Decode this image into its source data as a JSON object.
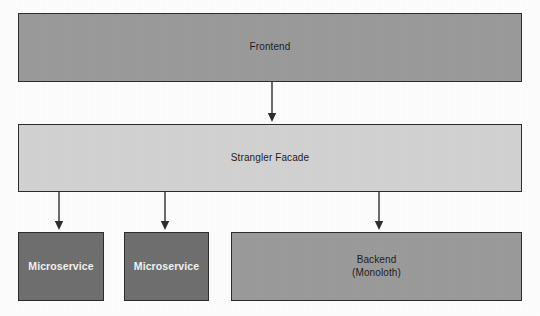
{
  "diagram": {
    "background_color": "#fdfdfd",
    "nodes": [
      {
        "id": "frontend",
        "label": "Frontend",
        "fill": "#9a9a9a",
        "border": "#2b2b2b",
        "text_color": "#1c1c1c",
        "x": 18,
        "y": 13,
        "w": 504,
        "h": 69
      },
      {
        "id": "strangler-facade",
        "label": "Strangler Facade",
        "fill": "#d2d2d2",
        "border": "#2b2b2b",
        "text_color": "#1c1c1c",
        "x": 18,
        "y": 124,
        "w": 504,
        "h": 68
      },
      {
        "id": "microservice-1",
        "label": "Microservice",
        "fill": "#6e6e6e",
        "border": "#2b2b2b",
        "text_color": "#f2f2f2",
        "x": 18,
        "y": 232,
        "w": 86,
        "h": 69
      },
      {
        "id": "microservice-2",
        "label": "Microservice",
        "fill": "#6e6e6e",
        "border": "#2b2b2b",
        "text_color": "#f2f2f2",
        "x": 124,
        "y": 232,
        "w": 85,
        "h": 69
      },
      {
        "id": "backend-monolith",
        "label": "Backend\n(Monoloth)",
        "fill": "#9a9a9a",
        "border": "#2b2b2b",
        "text_color": "#1c1c1c",
        "x": 231,
        "y": 232,
        "w": 291,
        "h": 69
      }
    ],
    "connectors": [
      {
        "id": "frontend-to-facade",
        "from": "frontend",
        "to": "strangler-facade",
        "x": 272,
        "y1": 82,
        "y2": 122,
        "color": "#2b2b2b"
      },
      {
        "id": "facade-to-microservice-1",
        "from": "strangler-facade",
        "to": "microservice-1",
        "x": 59,
        "y1": 192,
        "y2": 230,
        "color": "#2b2b2b"
      },
      {
        "id": "facade-to-microservice-2",
        "from": "strangler-facade",
        "to": "microservice-2",
        "x": 165,
        "y1": 192,
        "y2": 230,
        "color": "#2b2b2b"
      },
      {
        "id": "facade-to-backend",
        "from": "strangler-facade",
        "to": "backend-monolith",
        "x": 379,
        "y1": 192,
        "y2": 230,
        "color": "#2b2b2b"
      }
    ]
  }
}
